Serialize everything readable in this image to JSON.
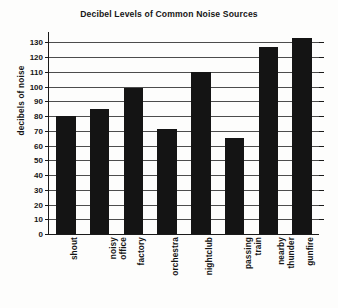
{
  "chart_data": {
    "type": "bar",
    "title": "Decibel Levels of Common Noise Sources",
    "xlabel": "",
    "ylabel": "decibels of noise",
    "categories": [
      "shout",
      "noisy office",
      "factory",
      "orchestra",
      "nightclub",
      "passing train",
      "nearby thunder",
      "gunfire"
    ],
    "category_lines": [
      [
        "shout"
      ],
      [
        "noisy",
        "office"
      ],
      [
        "factory"
      ],
      [
        "orchestra"
      ],
      [
        "nightclub"
      ],
      [
        "passing",
        "train"
      ],
      [
        "nearby",
        "thunder"
      ],
      [
        "gunfire"
      ]
    ],
    "values": [
      80,
      85,
      99,
      71,
      110,
      65,
      127,
      133
    ],
    "ylim": [
      0,
      137
    ],
    "yticks": [
      0,
      10,
      20,
      30,
      40,
      50,
      60,
      70,
      80,
      90,
      100,
      110,
      120,
      130
    ],
    "ytick_labels": [
      "0",
      "10",
      "20",
      "30",
      "40",
      "50",
      "60",
      "70",
      "80",
      "90",
      "100",
      "110",
      "120",
      "130"
    ],
    "grid": true,
    "legend": false,
    "bar_color": "#141414",
    "axis_color": "#1a1a1a",
    "grid_color": "#4c4c4c",
    "background_color": "#fdfdfc"
  }
}
